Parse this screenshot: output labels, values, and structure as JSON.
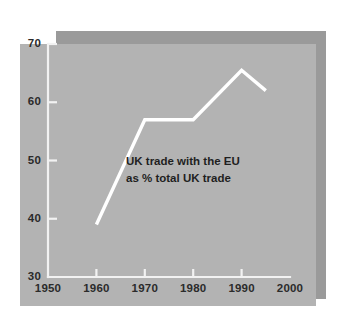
{
  "figure": {
    "panel_color": "#b3b3b3",
    "shadow_color": "#9a9a9a",
    "page_color": "#ffffff",
    "line_color": "#ffffff",
    "axis_color": "#f2f2f2",
    "text_color": "#1f1f1f"
  },
  "chart_data": {
    "type": "line",
    "title": "",
    "subtitle": "",
    "annotations": [
      "UK trade with the EU",
      "as % total UK trade"
    ],
    "xlabel": "",
    "ylabel": "",
    "xlim": [
      1950,
      2000
    ],
    "ylim": [
      30,
      70
    ],
    "xticks": [
      1950,
      1960,
      1970,
      1980,
      1990,
      2000
    ],
    "xtick_labels": [
      "1950",
      "1960",
      "1970",
      "1980",
      "1990",
      "2000"
    ],
    "yticks": [
      30,
      40,
      50,
      60,
      70
    ],
    "ytick_labels": [
      "30",
      "40",
      "50",
      "60",
      "70"
    ],
    "grid": false,
    "legend": false,
    "series": [
      {
        "name": "UK trade with the EU as % total UK trade",
        "color": "#ffffff",
        "x": [
          1960,
          1970,
          1980,
          1990,
          1995
        ],
        "values": [
          39,
          57,
          57,
          65.5,
          62
        ]
      }
    ]
  }
}
